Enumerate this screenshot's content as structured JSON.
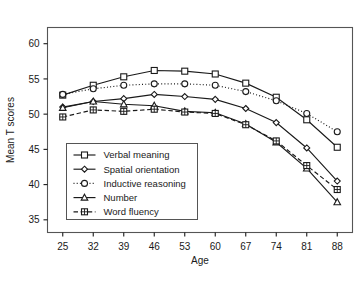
{
  "chart_data": {
    "type": "line",
    "title": "",
    "xlabel": "Age",
    "ylabel": "Mean T scores",
    "x": [
      25,
      32,
      39,
      46,
      53,
      60,
      67,
      74,
      81,
      88
    ],
    "xtick_labels": [
      "25",
      "32",
      "39",
      "46",
      "53",
      "60",
      "67",
      "74",
      "81",
      "88"
    ],
    "ytick_labels": [
      "35",
      "40",
      "45",
      "50",
      "55",
      "60"
    ],
    "yticks": [
      35,
      40,
      45,
      50,
      55,
      60
    ],
    "xlim": [
      21.5,
      91.5
    ],
    "ylim": [
      33.2,
      62.3
    ],
    "grid": false,
    "legend_position": "lower-left-inside",
    "series": [
      {
        "name": "Verbal meaning",
        "marker": "square",
        "line_style": "solid",
        "values": [
          52.7,
          54.1,
          55.3,
          56.2,
          56.1,
          55.7,
          54.4,
          52.4,
          49.2,
          45.3
        ]
      },
      {
        "name": "Spatial orientation",
        "marker": "diamond",
        "line_style": "solid",
        "values": [
          51.0,
          51.8,
          52.2,
          52.8,
          52.5,
          52.1,
          50.8,
          48.8,
          45.2,
          40.5
        ]
      },
      {
        "name": "Inductive reasoning",
        "marker": "circle",
        "line_style": "dotted",
        "values": [
          52.8,
          53.6,
          54.1,
          54.3,
          54.3,
          54.1,
          53.2,
          51.9,
          50.1,
          47.5
        ]
      },
      {
        "name": "Number",
        "marker": "triangle",
        "line_style": "solid",
        "values": [
          50.9,
          51.8,
          51.4,
          51.2,
          50.4,
          50.2,
          48.6,
          46.0,
          42.3,
          37.5
        ]
      },
      {
        "name": "Word fluency",
        "marker": "square-crossed",
        "line_style": "dashed",
        "values": [
          49.6,
          50.6,
          50.4,
          50.7,
          50.3,
          50.1,
          48.5,
          46.2,
          42.7,
          39.3
        ]
      }
    ]
  },
  "colors": {
    "ink": "#1a1a1a",
    "frame": "#555555",
    "background": "#ffffff"
  }
}
